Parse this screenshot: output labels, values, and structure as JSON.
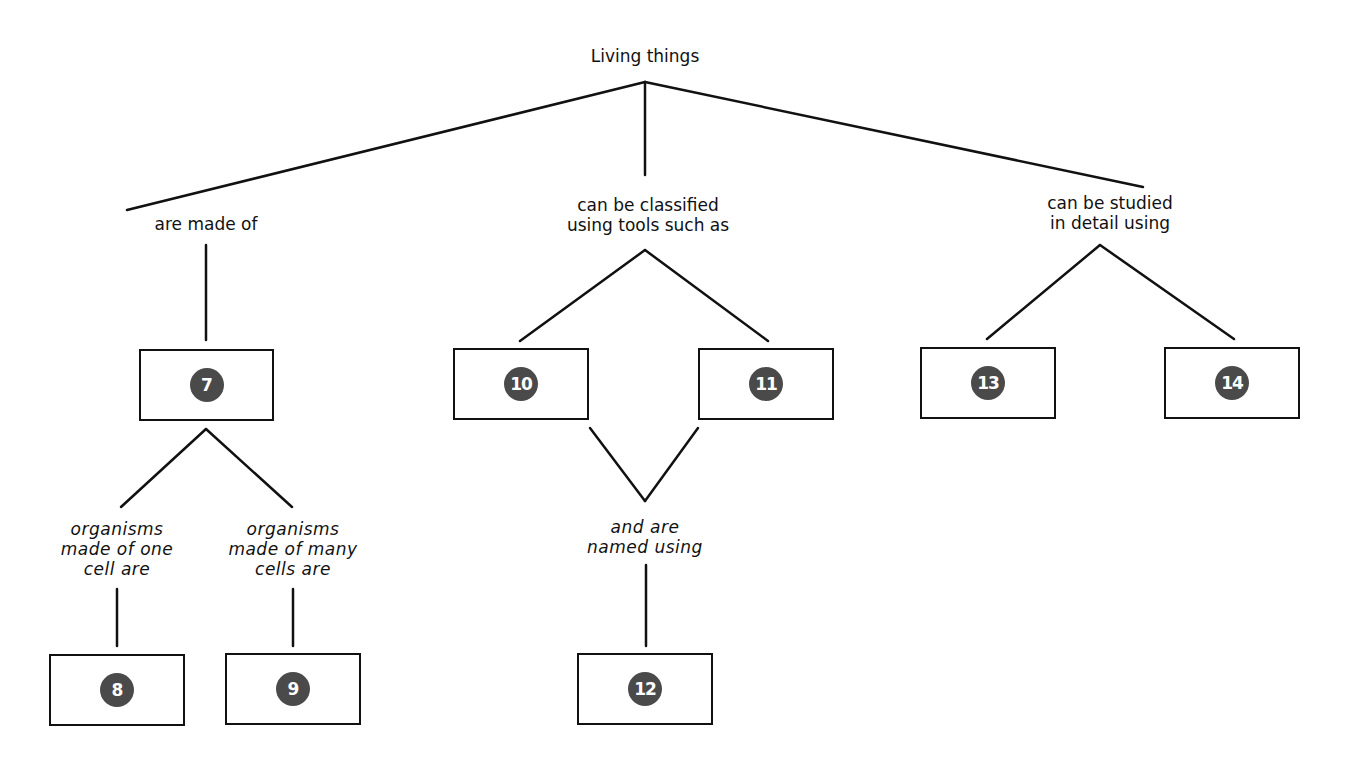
{
  "diagram": {
    "type": "concept-map",
    "root": "Living things",
    "links": [
      {
        "id": "are_made_of",
        "text": "are made of"
      },
      {
        "id": "classified",
        "text": "can be classified\nusing tools such as"
      },
      {
        "id": "studied",
        "text": "can be studied\nin detail using"
      },
      {
        "id": "one_cell",
        "text": "organisms\nmade of one\ncell are"
      },
      {
        "id": "many_cells",
        "text": "organisms\nmade of many\ncells are"
      },
      {
        "id": "named",
        "text": "and are\nnamed using"
      }
    ],
    "boxes": [
      {
        "number": "7"
      },
      {
        "number": "8"
      },
      {
        "number": "9"
      },
      {
        "number": "10"
      },
      {
        "number": "11"
      },
      {
        "number": "12"
      },
      {
        "number": "13"
      },
      {
        "number": "14"
      }
    ],
    "colors": {
      "line": "#111111",
      "badge": "#4a4a4a",
      "badge_text": "#ffffff",
      "background": "#ffffff"
    }
  }
}
